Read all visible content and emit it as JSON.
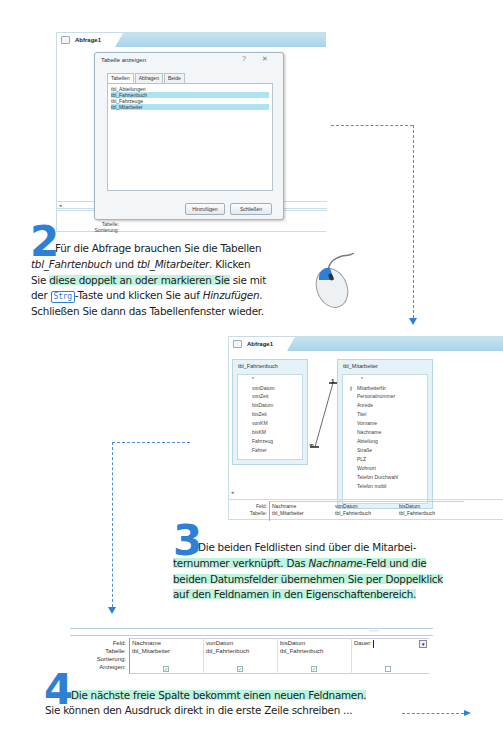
{
  "header_corner": {
    "text": ""
  },
  "window1": {
    "tab_label": "Abfrage1",
    "dialog": {
      "title": "Tabelle anzeigen",
      "help_icon": "?",
      "close_icon": "✕",
      "tabs": [
        {
          "label": "Tabellen",
          "active": true
        },
        {
          "label": "Abfragen",
          "active": false
        },
        {
          "label": "Beide",
          "active": false
        }
      ],
      "tables": [
        {
          "name": "tbl_Abteilungen",
          "selected": false
        },
        {
          "name": "tbl_Fahrtenbuch",
          "selected": true
        },
        {
          "name": "tbl_Fahrzeuge",
          "selected": false
        },
        {
          "name": "tbl_Mitarbeiter",
          "selected": true
        }
      ],
      "add_button": "Hinzufügen",
      "close_button": "Schließen"
    },
    "grid_labels": {
      "field": "Fe",
      "table": "Tabelle:",
      "sort": "Sortierung:"
    }
  },
  "step2": {
    "number": "2",
    "line1": "Für die Abfrage brauchen Sie die Tabellen",
    "line2_a": "tbl_Fahrtenbuch",
    "line2_b": " und ",
    "line2_c": "tbl_Mitarbeiter",
    "line2_d": ". Klicken",
    "line3_a": "Sie ",
    "line3_b": "diese doppelt an oder markieren Sie",
    "line3_c": " sie mit",
    "line4_a": "der ",
    "line4_key": "Strg",
    "line4_b": "-Taste und klicken Sie auf ",
    "line4_c": "Hinzufügen",
    "line4_d": ".",
    "line5": "Schließen Sie dann das Tabellenfenster wieder."
  },
  "window2": {
    "tab_label": "Abfrage1",
    "tables": [
      {
        "title": "tbl_Fahrtenbuch",
        "fields": [
          "*",
          "vonDatum",
          "vonZeit",
          "bisDatum",
          "bisZeit",
          "vonKM",
          "bisKM",
          "Fahrzeug",
          "Fahrer"
        ]
      },
      {
        "title": "tbl_Mitarbeiter",
        "key_icon": "🔑",
        "fields": [
          "*",
          "MitarbeiterNr",
          "Personalnummer",
          "Anrede",
          "Titel",
          "Vorname",
          "Nachname",
          "Abteilung",
          "Straße",
          "PLZ",
          "Wohnort",
          "Telefon Durchwahl",
          "Telefon mobil"
        ]
      }
    ],
    "relation": {
      "one": "1",
      "many": "∞"
    },
    "grid": {
      "labels": {
        "field": "Feld:",
        "table": "Tabelle:"
      },
      "columns": [
        {
          "field": "Nachname",
          "table": "tbl_Mitarbeiter"
        },
        {
          "field": "vonDatum",
          "table": "tbl_Fahrtenbuch"
        },
        {
          "field": "bisDatum",
          "table": "tbl_Fahrtenbuch"
        }
      ]
    }
  },
  "step3": {
    "number": "3",
    "line1": "Die beiden Feldlisten sind über die Mitarbei-",
    "line2_a": "ternummer verknüpft. Das ",
    "line2_b": "Nachname",
    "line2_c": "-Feld und die",
    "line3": "beiden Datumsfelder übernehmen Sie per Doppelklick",
    "line4": "auf den Feldnamen in den Eigenschaftenbereich."
  },
  "window3": {
    "labels": {
      "field": "Feld:",
      "table": "Tabelle:",
      "sort": "Sortierung:",
      "show": "Anzeigen:"
    },
    "columns": [
      {
        "field": "Nachname",
        "table": "tbl_Mitarbeiter",
        "show": true
      },
      {
        "field": "vonDatum",
        "table": "tbl_Fahrtenbuch",
        "show": true
      },
      {
        "field": "bisDatum",
        "table": "tbl_Fahrtenbuch",
        "show": true
      },
      {
        "field": "Dauer:",
        "table": "",
        "show": false
      }
    ],
    "check_glyph": "✓",
    "dropdown_glyph": "▾"
  },
  "step4": {
    "number": "4",
    "line1": "Die nächste freie Spalte bekommt einen neuen Feldnamen.",
    "line2": "Sie können den Ausdruck direkt in die erste Zeile schreiben ..."
  },
  "colors": {
    "accent_blue": "#2e7fd6",
    "highlight_green": "#6ee8b4",
    "titlebar_blue": "#a9d4e8",
    "selection": "#aee3f2"
  }
}
